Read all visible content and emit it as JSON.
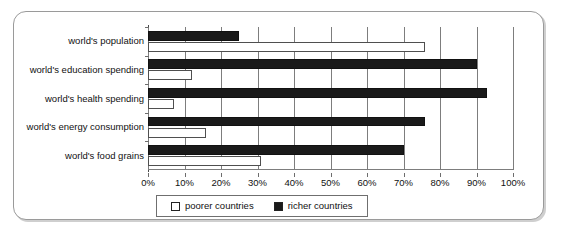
{
  "chart_data": {
    "type": "bar",
    "orientation": "horizontal",
    "title": "",
    "xlabel": "",
    "ylabel": "",
    "xlim": [
      0,
      100
    ],
    "xunit": "%",
    "grid": true,
    "legend_position": "bottom",
    "categories": [
      "world's population",
      "world's education spending",
      "world's health spending",
      "world's energy consumption",
      "world's food grains"
    ],
    "tick_labels": [
      "0%",
      "10%",
      "20%",
      "30%",
      "40%",
      "50%",
      "60%",
      "70%",
      "80%",
      "90%",
      "100%"
    ],
    "tick_values": [
      0,
      10,
      20,
      30,
      40,
      50,
      60,
      70,
      80,
      90,
      100
    ],
    "series": [
      {
        "name": "richer countries",
        "color": "#1a1a1a",
        "values": [
          25,
          90,
          93,
          76,
          70
        ]
      },
      {
        "name": "poorer countries",
        "color": "#ffffff",
        "values": [
          76,
          12,
          7,
          16,
          31
        ]
      }
    ]
  },
  "legend": {
    "items": [
      {
        "label": "poorer countries",
        "swatch": "white-square-icon"
      },
      {
        "label": "richer countries",
        "swatch": "black-square-icon"
      }
    ]
  }
}
